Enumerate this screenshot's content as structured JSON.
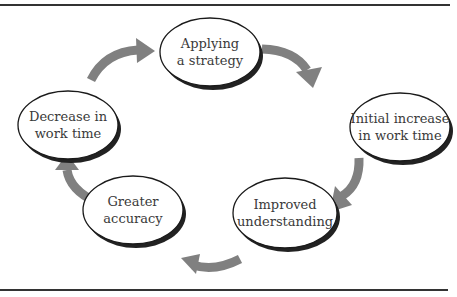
{
  "diagram": {
    "type": "cycle",
    "colors": {
      "arrow": "#808080",
      "ellipse_border": "#1a1a1a",
      "ellipse_shadow": "#222222",
      "ellipse_fill": "#ffffff",
      "rule": "#333333",
      "text": "#3a3a3a"
    },
    "nodes": [
      {
        "id": "applying-strategy",
        "lines": [
          "Applying",
          "a strategy"
        ],
        "cx": 210,
        "cy": 52
      },
      {
        "id": "initial-increase",
        "lines": [
          "Initial increase",
          "in work time"
        ],
        "cx": 400,
        "cy": 127
      },
      {
        "id": "improved-understanding",
        "lines": [
          "Improved",
          "understanding"
        ],
        "cx": 285,
        "cy": 213
      },
      {
        "id": "greater-accuracy",
        "lines": [
          "Greater",
          "accuracy"
        ],
        "cx": 133,
        "cy": 210
      },
      {
        "id": "decrease-work-time",
        "lines": [
          "Decrease in",
          "work time"
        ],
        "cx": 68,
        "cy": 125
      }
    ],
    "edges": [
      {
        "from": "applying-strategy",
        "to": "initial-increase"
      },
      {
        "from": "initial-increase",
        "to": "improved-understanding"
      },
      {
        "from": "improved-understanding",
        "to": "greater-accuracy"
      },
      {
        "from": "greater-accuracy",
        "to": "decrease-work-time"
      },
      {
        "from": "decrease-work-time",
        "to": "applying-strategy"
      }
    ]
  }
}
